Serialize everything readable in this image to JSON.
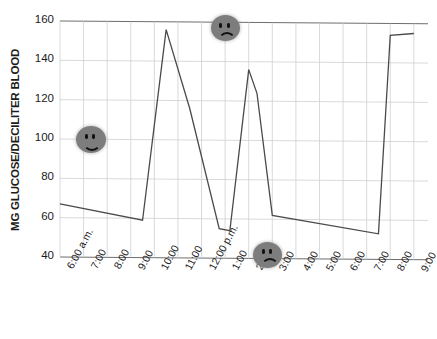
{
  "chart_data": {
    "type": "line",
    "title": "",
    "xlabel": "",
    "ylabel": "MG GLUCOSE/DECILITER BLOOD",
    "ylim": [
      40,
      160
    ],
    "yticks": [
      40,
      60,
      80,
      100,
      120,
      140,
      160
    ],
    "ytick_labels": [
      "40",
      "60",
      "80",
      "100",
      "120",
      "140",
      "160"
    ],
    "grid": true,
    "legend": "none",
    "categories": [
      "6:00 a.m.",
      "7:00",
      "8:00",
      "9:00",
      "10:00",
      "11:00",
      "12:00 p.m.",
      "1:00",
      "2:00",
      "3:00",
      "4:00",
      "5:00",
      "6:00",
      "7:00",
      "8:00",
      "9:00"
    ],
    "series": [
      {
        "name": "Blood glucose",
        "color": "#4a4a4a",
        "points": [
          {
            "x": "6:00 a.m.",
            "hour": 6.0,
            "y": 67
          },
          {
            "x": "9:30",
            "hour": 9.5,
            "y": 59
          },
          {
            "x": "10:30",
            "hour": 10.5,
            "y": 156
          },
          {
            "x": "11:30",
            "hour": 11.5,
            "y": 116
          },
          {
            "x": "12:45",
            "hour": 12.75,
            "y": 55
          },
          {
            "x": "1:10",
            "hour": 13.2,
            "y": 54
          },
          {
            "x": "2:00",
            "hour": 14.0,
            "y": 136
          },
          {
            "x": "2:20",
            "hour": 14.35,
            "y": 124
          },
          {
            "x": "3:00",
            "hour": 15.0,
            "y": 62
          },
          {
            "x": "7:30",
            "hour": 19.5,
            "y": 53
          },
          {
            "x": "8:00",
            "hour": 20.0,
            "y": 154
          },
          {
            "x": "9:00",
            "hour": 21.0,
            "y": 155
          }
        ]
      }
    ],
    "annotations": [
      {
        "kind": "happy-face",
        "label": "happy-face-icon",
        "hour": 7.3,
        "value": 100
      },
      {
        "kind": "sad-face",
        "label": "sad-face-icon",
        "hour": 13.0,
        "value": 157
      },
      {
        "kind": "sad-face",
        "label": "sad-face-icon",
        "hour": 14.8,
        "value": 42
      }
    ]
  },
  "colors": {
    "line": "#4a4a4a",
    "grid": "#cfcfcf",
    "axis": "#6e6e6e",
    "text": "#1b1b1b",
    "face_fill": "#7d7d7d",
    "face_feature": "#111111",
    "background": "#ffffff"
  }
}
